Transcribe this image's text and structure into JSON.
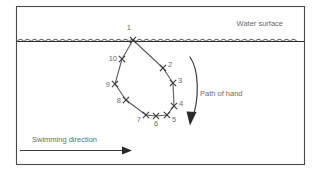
{
  "figure": {
    "frame": {
      "x": 16,
      "y": 6,
      "width": 289,
      "height": 159
    },
    "colors": {
      "frame": "#4a4a4a",
      "water": "#2a2a2a",
      "path": "#5c5c5c",
      "marker": "#3b3b3b",
      "arrow": "#2a2a2a",
      "text": "#6b6b6b",
      "background": "#ffffff"
    }
  },
  "labels": {
    "water_surface": "Water surface",
    "path_of_hand": "Path of hand",
    "swimming_direction": "Swimming direction"
  },
  "chart_data": {
    "type": "scatter",
    "title": "Path of hand",
    "xlabel": "",
    "ylabel": "",
    "annotations": [
      {
        "name": "water-surface-label",
        "text": "Water surface",
        "x": 283,
        "y": 26
      },
      {
        "name": "path-of-hand-label",
        "text": "Path of hand",
        "x": 200,
        "y": 96
      },
      {
        "name": "swimming-direction-label",
        "text": "Swimming direction",
        "x": 32,
        "y": 142
      }
    ],
    "water_surface_y": 41,
    "points": [
      {
        "id": "1",
        "x": 133,
        "y": 40,
        "label_x": 131,
        "label_y": 30,
        "label_anchor": "end"
      },
      {
        "id": "2",
        "x": 163,
        "y": 68,
        "label_x": 168,
        "label_y": 67,
        "label_anchor": "start"
      },
      {
        "id": "3",
        "x": 173,
        "y": 83,
        "label_x": 178,
        "label_y": 83,
        "label_anchor": "start"
      },
      {
        "id": "4",
        "x": 174,
        "y": 106,
        "label_x": 179,
        "label_y": 106,
        "label_anchor": "start"
      },
      {
        "id": "5",
        "x": 167,
        "y": 115,
        "label_x": 172,
        "label_y": 122,
        "label_anchor": "start"
      },
      {
        "id": "6",
        "x": 156,
        "y": 116,
        "label_x": 156,
        "label_y": 126,
        "label_anchor": "middle"
      },
      {
        "id": "7",
        "x": 146,
        "y": 115,
        "label_x": 141,
        "label_y": 122,
        "label_anchor": "end"
      },
      {
        "id": "8",
        "x": 126,
        "y": 100,
        "label_x": 121,
        "label_y": 103,
        "label_anchor": "end"
      },
      {
        "id": "9",
        "x": 115,
        "y": 84,
        "label_x": 110,
        "label_y": 87,
        "label_anchor": "end"
      },
      {
        "id": "10",
        "x": 122,
        "y": 59,
        "label_x": 117,
        "label_y": 61,
        "label_anchor": "end"
      }
    ],
    "path_closed": true,
    "curved_arrow": {
      "name": "path-of-hand-arrow",
      "start": [
        190,
        57
      ],
      "end": [
        189,
        124
      ],
      "direction": "clockwise-down"
    },
    "direction_arrow": {
      "name": "swimming-direction-arrow",
      "start": [
        20,
        150
      ],
      "end": [
        131,
        150
      ],
      "direction": "right"
    }
  }
}
